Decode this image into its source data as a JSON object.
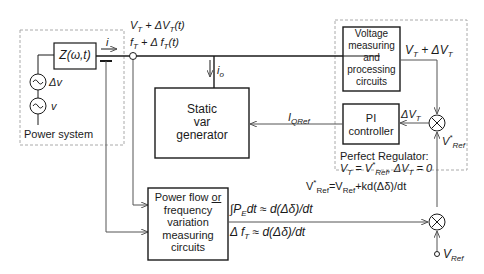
{
  "power_system": {
    "label": "Power system",
    "impedance": "Z(ω,t)",
    "current": "i",
    "source_delta": "Δv",
    "source": "v"
  },
  "bus": {
    "voltage": "V",
    "voltage_sub": "T",
    "voltage_delta": "+ ΔV",
    "voltage_delta_sub": "T",
    "voltage_tail": "(t)",
    "freq": "f",
    "freq_sub": "T",
    "freq_delta": "+ Δ f",
    "freq_delta_sub": "T",
    "freq_tail": "(t)"
  },
  "svg_block": {
    "line1": "Static",
    "line2": "var",
    "line3": "generator",
    "output_current": "i",
    "output_current_sub": "o"
  },
  "voltage_block": {
    "line1": "Voltage",
    "line2": "measuring",
    "line3": "and",
    "line4": "processing",
    "line5": "circuits",
    "output": "V",
    "output_sub": "T",
    "output_delta": " + ΔV",
    "output_delta_sub": "T"
  },
  "pi_block": {
    "line1": "PI",
    "line2": "controller",
    "input": "ΔV",
    "input_sub": "T",
    "output": "I",
    "output_sub": "QRef"
  },
  "regulator": {
    "title": "Perfect Regulator:",
    "eq": "V",
    "eq_sub": "T",
    "eq_mid": " = V",
    "eq_sup": "*",
    "eq_sub2": "Ref",
    "eq_tail": ", ΔV",
    "eq_sub3": "T",
    "eq_end": " = 0"
  },
  "vref_star": {
    "label": "V",
    "sup": "*",
    "sub": "Ref"
  },
  "vref_equation": {
    "lhs": "V",
    "lhs_sup": "*",
    "lhs_sub": "Ref",
    "mid": "=V",
    "mid_sub": "Ref",
    "rhs": "+kd(Δδ)/dt"
  },
  "power_flow_block": {
    "line1": "Power flow ",
    "line1_or": "or",
    "line2": "frequency",
    "line3": "variation",
    "line4": "measuring",
    "line5": "circuits",
    "out1": "∫P",
    "out1_sub": "E",
    "out1_tail": "dt ≈ d(Δδ)/dt",
    "out2": "Δ f",
    "out2_sub": "T",
    "out2_tail": " ≈ d(Δδ)/dt"
  },
  "vref": {
    "label": "V",
    "sub": "Ref"
  },
  "colors": {
    "line": "#1a1a1a",
    "signal": "#555555",
    "dashed": "#aaaaaa"
  }
}
